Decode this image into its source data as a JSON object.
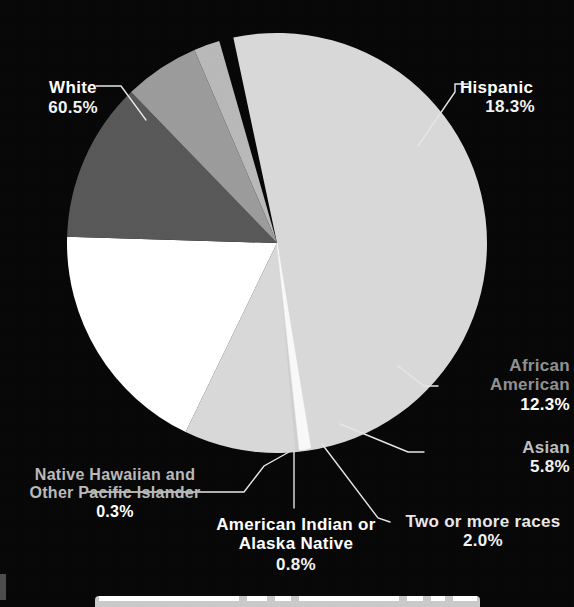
{
  "figure": {
    "background_color": "#050505",
    "label_color": "#ffffff"
  },
  "chart_data": {
    "type": "pie",
    "title": "",
    "subtitle": "",
    "xlabel": "",
    "ylabel": "",
    "legend_position": "none-callout-labels",
    "grid": false,
    "units": "percent",
    "total": 100.0,
    "start_angle_deg": -12,
    "direction": "clockwise",
    "categories": [
      "White",
      "Hispanic",
      "African American",
      "Asian",
      "Two or more races",
      "American Indian or Alaska Native",
      "Native Hawaiian and Other Pacific Islander"
    ],
    "values": [
      60.5,
      18.3,
      12.3,
      5.8,
      2.0,
      0.8,
      0.3
    ],
    "slices": [
      {
        "label": "White",
        "label_line1": "White",
        "label_line2": "",
        "value": 60.5,
        "value_text": "60.5%",
        "color": "#d8d8d8",
        "label_color": "#ffffff"
      },
      {
        "label": "Hispanic",
        "label_line1": "Hispanic",
        "label_line2": "",
        "value": 18.3,
        "value_text": "18.3%",
        "color": "#ffffff",
        "label_color": "#ffffff"
      },
      {
        "label": "African American",
        "label_line1": "African",
        "label_line2": "American",
        "value": 12.3,
        "value_text": "12.3%",
        "color": "#565656",
        "label_color": "#8f8f8f"
      },
      {
        "label": "Asian",
        "label_line1": "Asian",
        "label_line2": "",
        "value": 5.8,
        "value_text": "5.8%",
        "color": "#9a9a9a",
        "label_color": "#bdbdbd"
      },
      {
        "label": "Two or more races",
        "label_line1": "Two or more races",
        "label_line2": "",
        "value": 2.0,
        "value_text": "2.0%",
        "color": "#b8b8b8",
        "label_color": "#e8e8e8"
      },
      {
        "label": "American Indian or Alaska Native",
        "label_line1": "American Indian or",
        "label_line2": "Alaska Native",
        "value": 0.8,
        "value_text": "0.8%",
        "color": "#f2f2f2",
        "label_color": "#ffffff"
      },
      {
        "label": "Native Hawaiian and Other Pacific Islander",
        "label_line1": "Native Hawaiian and",
        "label_line2": "Other Pacific Islander",
        "value": 0.3,
        "value_text": "0.3%",
        "color": "#cfcfcf",
        "label_color": "#b9b9b9"
      }
    ]
  },
  "labels": {
    "white": {
      "name": "White",
      "pct": "60.5%"
    },
    "hispanic": {
      "name": "Hispanic",
      "pct": "18.3%"
    },
    "african": {
      "name_line1": "African",
      "name_line2": "American",
      "pct": "12.3%"
    },
    "asian": {
      "name": "Asian",
      "pct": "5.8%"
    },
    "two_or_more": {
      "name": "Two or more races",
      "pct": "2.0%"
    },
    "american_indian": {
      "name_line1": "American Indian or",
      "name_line2": "Alaska Native",
      "pct": "0.8%"
    },
    "native_hawaiian": {
      "name_line1": "Native Hawaiian and",
      "name_line2": "Other Pacific Islander",
      "pct": "0.3%"
    }
  }
}
